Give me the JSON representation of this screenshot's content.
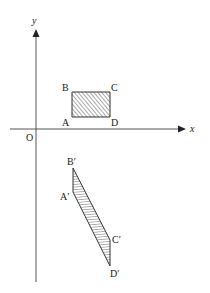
{
  "diagram": {
    "type": "coordinate-transformation",
    "axes": {
      "x_label": "x",
      "y_label": "y",
      "origin_label": "O",
      "origin": [
        36,
        129
      ]
    },
    "original_shape": {
      "name": "rectangle ABCD",
      "shading": "hatched",
      "vertices": {
        "A": {
          "label": "A",
          "point": [
            72,
            117
          ]
        },
        "B": {
          "label": "B",
          "point": [
            72,
            92
          ]
        },
        "C": {
          "label": "C",
          "point": [
            110,
            92
          ]
        },
        "D": {
          "label": "D",
          "point": [
            110,
            117
          ]
        }
      }
    },
    "image_shape": {
      "name": "parallelogram A'B'C'D'",
      "shading": "hatched",
      "vertices": {
        "A_prime": {
          "label": "A′",
          "point": [
            73,
            192
          ]
        },
        "B_prime": {
          "label": "B′",
          "point": [
            73,
            168
          ]
        },
        "C_prime": {
          "label": "C′",
          "point": [
            110,
            240
          ]
        },
        "D_prime": {
          "label": "D′",
          "point": [
            110,
            266
          ]
        }
      }
    },
    "colors": {
      "line": "#333333",
      "hatch": "#444444",
      "background": "#ffffff"
    }
  }
}
